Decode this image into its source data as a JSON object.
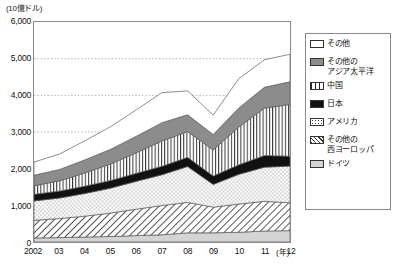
{
  "chart_data": {
    "type": "area",
    "stacked": true,
    "title": "",
    "subtitle": "",
    "xlabel": "(年)",
    "ylabel": "",
    "unit_label": "(10億ドル)",
    "x": [
      2002,
      2003,
      2004,
      2005,
      2006,
      2007,
      2008,
      2009,
      2010,
      2011,
      2012
    ],
    "categories": [
      "2002",
      "03",
      "04",
      "05",
      "06",
      "07",
      "08",
      "09",
      "10",
      "11",
      "12"
    ],
    "xtick_labels": [
      "2002",
      "03",
      "04",
      "05",
      "06",
      "07",
      "08",
      "09",
      "10",
      "11",
      "12"
    ],
    "ytick_labels": [
      "0",
      "1,000",
      "2,000",
      "3,000",
      "4,000",
      "5,000",
      "6,000"
    ],
    "ytick_values": [
      0,
      1000,
      2000,
      3000,
      4000,
      5000,
      6000
    ],
    "ylim": [
      0,
      6000
    ],
    "xlim": [
      2002,
      2012
    ],
    "grid": "horizontal-dotted",
    "legend_position": "right-outside",
    "series": [
      {
        "name": "ドイツ",
        "fill": "#d4d4d4",
        "pattern": "solid-light-gray",
        "values": [
          110,
          120,
          135,
          150,
          175,
          195,
          250,
          250,
          265,
          300,
          310
        ]
      },
      {
        "name": "その他の西ヨーロッパ",
        "fill": "#ffffff",
        "pattern": "diagonal-hatch",
        "values": [
          480,
          520,
          570,
          640,
          720,
          800,
          830,
          700,
          770,
          810,
          760
        ]
      },
      {
        "name": "アメリカ",
        "fill": "#ffffff",
        "pattern": "dotted",
        "values": [
          530,
          560,
          620,
          680,
          760,
          840,
          980,
          620,
          810,
          930,
          1000
        ]
      },
      {
        "name": "日本",
        "fill": "#111111",
        "pattern": "solid-black",
        "values": [
          180,
          190,
          200,
          210,
          220,
          230,
          250,
          230,
          260,
          320,
          270
        ]
      },
      {
        "name": "中国",
        "fill": "#ffffff",
        "pattern": "vertical-lines",
        "values": [
          230,
          280,
          360,
          450,
          560,
          690,
          700,
          710,
          1030,
          1290,
          1410
        ]
      },
      {
        "name": "その他のアジア太平洋",
        "fill": "#8c8c8c",
        "pattern": "solid-gray",
        "values": [
          290,
          310,
          360,
          400,
          450,
          500,
          460,
          420,
          520,
          570,
          620
        ]
      },
      {
        "name": "その他",
        "fill": "#ffffff",
        "pattern": "white-outline",
        "values": [
          360,
          420,
          520,
          620,
          720,
          820,
          650,
          530,
          800,
          750,
          750
        ]
      }
    ],
    "totals": [
      2180,
      2400,
      2765,
      3150,
      3605,
      4075,
      4120,
      3460,
      4455,
      4970,
      5120
    ],
    "annotations": []
  },
  "axes": {
    "y_unit": "(10億ドル)",
    "x_unit": "(年)"
  },
  "legend": {
    "items": [
      {
        "label": "その他",
        "swatch_class": "sw-other",
        "name": "other"
      },
      {
        "label": "その他の\nアジア太平洋",
        "swatch_class": "sw-asiapac",
        "name": "other-asia-pacific"
      },
      {
        "label": "中国",
        "swatch_class": "sw-china",
        "name": "china"
      },
      {
        "label": "日本",
        "swatch_class": "sw-japan",
        "name": "japan"
      },
      {
        "label": "アメリカ",
        "swatch_class": "sw-usa",
        "name": "usa"
      },
      {
        "label": "その他の\n西ヨーロッパ",
        "swatch_class": "sw-weurope",
        "name": "other-western-europe"
      },
      {
        "label": "ドイツ",
        "swatch_class": "sw-germany",
        "name": "germany"
      }
    ]
  }
}
